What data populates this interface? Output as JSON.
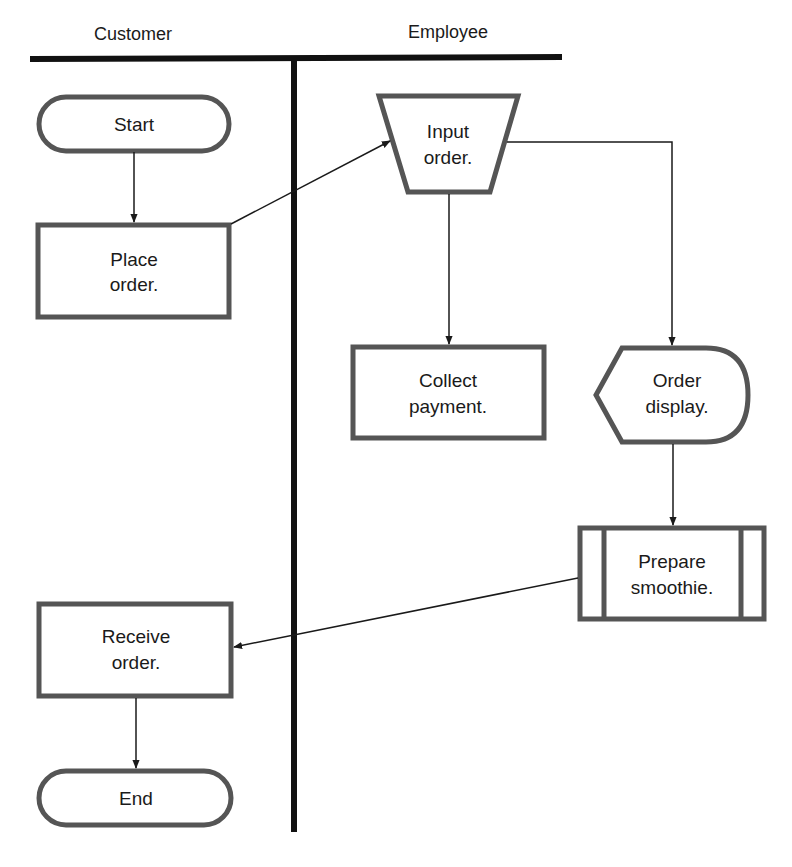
{
  "lanes": {
    "customer": "Customer",
    "employee": "Employee"
  },
  "nodes": {
    "start": {
      "line1": "Start",
      "shape": "terminator"
    },
    "place_order": {
      "line1": "Place",
      "line2": "order.",
      "shape": "process"
    },
    "input_order": {
      "line1": "Input",
      "line2": "order.",
      "shape": "manual-input"
    },
    "collect_payment": {
      "line1": "Collect",
      "line2": "payment.",
      "shape": "process"
    },
    "order_display": {
      "line1": "Order",
      "line2": "display.",
      "shape": "display"
    },
    "prepare_smoothie": {
      "line1": "Prepare",
      "line2": "smoothie.",
      "shape": "predefined-process"
    },
    "receive_order": {
      "line1": "Receive",
      "line2": "order.",
      "shape": "process"
    },
    "end": {
      "line1": "End",
      "shape": "terminator"
    }
  },
  "edges": [
    {
      "from": "Start",
      "to": "Place order."
    },
    {
      "from": "Place order.",
      "to": "Input order."
    },
    {
      "from": "Input order.",
      "to": "Collect payment."
    },
    {
      "from": "Input order.",
      "to": "Order display."
    },
    {
      "from": "Order display.",
      "to": "Prepare smoothie."
    },
    {
      "from": "Prepare smoothie.",
      "to": "Receive order."
    },
    {
      "from": "Receive order.",
      "to": "End"
    }
  ],
  "colors": {
    "stroke": "#555555",
    "lane_line": "#111111",
    "text": "#1a1a1a",
    "background": "#ffffff"
  }
}
